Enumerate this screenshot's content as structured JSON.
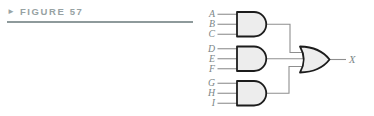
{
  "figure": {
    "marker": "►",
    "label": "FIGURE 57"
  },
  "circuit": {
    "type": "logic-diagram",
    "inputs": [
      "A",
      "B",
      "C",
      "D",
      "E",
      "F",
      "G",
      "H",
      "I"
    ],
    "output_label": "X",
    "gates": [
      {
        "id": "and1",
        "type": "AND",
        "inputs": [
          "A",
          "B",
          "C"
        ]
      },
      {
        "id": "and2",
        "type": "AND",
        "inputs": [
          "D",
          "E",
          "F"
        ]
      },
      {
        "id": "and3",
        "type": "AND",
        "inputs": [
          "G",
          "H",
          "I"
        ]
      },
      {
        "id": "or1",
        "type": "OR",
        "inputs": [
          "and1",
          "and2",
          "and3"
        ],
        "output": "X"
      }
    ]
  },
  "colors": {
    "figure_label": "#97a2a3",
    "rule": "#8e9a9b",
    "gate_fill": "#ededed",
    "gate_outline": "#1c1c1c",
    "wire": "#8f8f8f",
    "signal_label": "#7b8687"
  }
}
